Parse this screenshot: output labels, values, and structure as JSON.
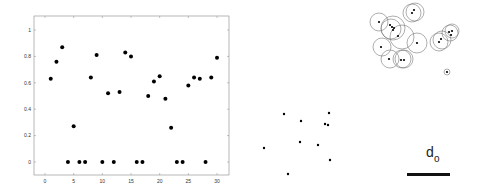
{
  "chart_data": [
    {
      "type": "scatter",
      "title": "",
      "xlabel": "",
      "ylabel": "",
      "xlim": [
        -1,
        31.5
      ],
      "ylim": [
        -0.1,
        1.1
      ],
      "grid": false,
      "x_ticks": [
        "0",
        "5",
        "10",
        "15",
        "20",
        "25",
        "30"
      ],
      "y_ticks": [
        "0",
        "0.2",
        "0.4",
        "0.6",
        "0.8",
        "1"
      ],
      "x": [
        1,
        2,
        3,
        4,
        5,
        6,
        7,
        8,
        9,
        10,
        11,
        12,
        13,
        14,
        15,
        16,
        17,
        18,
        19,
        20,
        21,
        22,
        23,
        24,
        25,
        26,
        27,
        28,
        29,
        30
      ],
      "y": [
        0.63,
        0.76,
        0.87,
        0,
        0.27,
        0,
        0,
        0.64,
        0.81,
        0,
        0.52,
        0,
        0.53,
        0.83,
        0.8,
        0,
        0,
        0.5,
        0.61,
        0.65,
        0.48,
        0.26,
        0,
        0,
        0.58,
        0.64,
        0.63,
        0,
        0.64,
        0.79
      ],
      "marker": "filled-circle",
      "color": "#000000"
    },
    {
      "type": "scatter",
      "title": "",
      "description": "unlabeled point set (no axes)",
      "points_px": [
        [
          264,
          148
        ],
        [
          284,
          114
        ],
        [
          301,
          121
        ],
        [
          300,
          142
        ],
        [
          318,
          145
        ],
        [
          325,
          124
        ],
        [
          328,
          125
        ],
        [
          329,
          113
        ],
        [
          330,
          160
        ],
        [
          288,
          174
        ]
      ],
      "color": "#000000"
    },
    {
      "type": "scatter",
      "title": "",
      "description": "points with surrounding circles of radius d_o (no axes)",
      "points_px": [
        [
          379,
          22
        ],
        [
          390,
          25
        ],
        [
          392,
          27
        ],
        [
          393,
          30
        ],
        [
          394,
          28
        ],
        [
          398,
          36
        ],
        [
          412,
          13
        ],
        [
          414,
          10
        ],
        [
          381,
          47
        ],
        [
          417,
          43
        ],
        [
          389,
          59
        ],
        [
          401,
          60
        ],
        [
          404,
          60
        ],
        [
          439,
          42
        ],
        [
          441,
          39
        ],
        [
          449,
          32
        ],
        [
          451,
          35
        ],
        [
          452,
          31
        ],
        [
          447,
          72
        ]
      ],
      "circles_px": [
        [
          379,
          22,
          9
        ],
        [
          393,
          28,
          12
        ],
        [
          391,
          29,
          10
        ],
        [
          402,
          37,
          12
        ],
        [
          412,
          13,
          9
        ],
        [
          415,
          12,
          9
        ],
        [
          382,
          47,
          9
        ],
        [
          417,
          43,
          10
        ],
        [
          390,
          59,
          9
        ],
        [
          402,
          59,
          9
        ],
        [
          404,
          59,
          9
        ],
        [
          439,
          42,
          9
        ],
        [
          442,
          40,
          9
        ],
        [
          450,
          33,
          8
        ],
        [
          452,
          31,
          7
        ],
        [
          447,
          72,
          3
        ]
      ],
      "color": "#000000",
      "circle_color": "#777777"
    }
  ],
  "scale_bar": {
    "label_main": "d",
    "label_sub": "o",
    "length_px": 43
  }
}
